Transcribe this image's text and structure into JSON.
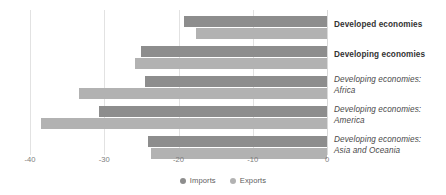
{
  "chart_data": {
    "type": "bar",
    "orientation": "horizontal",
    "title": "",
    "xlabel": "",
    "ylabel": "",
    "xlim": [
      -40,
      0
    ],
    "xticks": [
      -40,
      -30,
      -20,
      -10,
      0
    ],
    "xtick_labels": [
      "-40",
      "-30",
      "-20",
      "-10",
      "0"
    ],
    "grid": true,
    "legend_position": "bottom-center",
    "categories": [
      "Developed economies",
      "Developing economies",
      "Developing economies: Africa",
      "Developing economies: America",
      "Developing economies: Asia and Oceania"
    ],
    "series": [
      {
        "name": "Imports",
        "color": "#8d8d8d",
        "values": [
          -19.2,
          -25.0,
          -24.5,
          -30.7,
          -24.1
        ]
      },
      {
        "name": "Exports",
        "color": "#b2b2b2",
        "values": [
          -17.6,
          -25.9,
          -33.4,
          -38.5,
          -23.7
        ]
      }
    ]
  },
  "categories": [
    {
      "line1": "Developed economies",
      "line2": "",
      "style": "bold"
    },
    {
      "line1": "Developing economies",
      "line2": "",
      "style": "bold"
    },
    {
      "line1": "Developing economies:",
      "line2": "Africa",
      "style": "italic"
    },
    {
      "line1": "Developing economies:",
      "line2": "America",
      "style": "italic"
    },
    {
      "line1": "Developing economies:",
      "line2": "Asia and Oceania",
      "style": "italic"
    }
  ],
  "axis": {
    "ticks": [
      {
        "label": "-40"
      },
      {
        "label": "-30"
      },
      {
        "label": "-20"
      },
      {
        "label": "-10"
      },
      {
        "label": "0"
      }
    ]
  },
  "legend": {
    "items": [
      {
        "label": "Imports",
        "color": "#8d8d8d"
      },
      {
        "label": "Exports",
        "color": "#b2b2b2"
      }
    ]
  }
}
